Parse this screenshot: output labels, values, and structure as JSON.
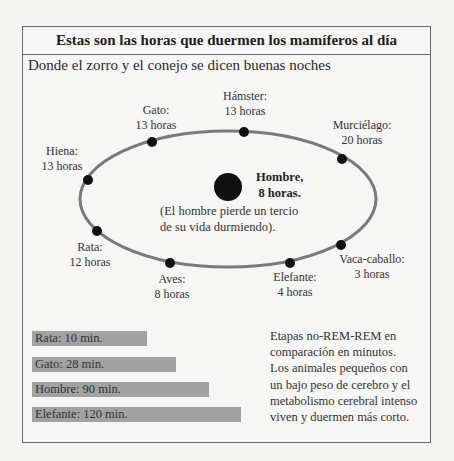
{
  "title": "Estas son las horas que duermen los mamíferos al día",
  "subtitle": "Donde el zorro y el conejo se dicen buenas noches",
  "center": {
    "label_line1": "Hombre,",
    "label_line2": "8 horas.",
    "caption_line1": "(El hombre pierde un tercio",
    "caption_line2": "de su vida durmiendo)."
  },
  "orbit": [
    {
      "animal": "Gato:",
      "hours": "13 horas"
    },
    {
      "animal": "Hámster:",
      "hours": "13 horas"
    },
    {
      "animal": "Murciélago:",
      "hours": "20 horas"
    },
    {
      "animal": "Hiena:",
      "hours": "13 horas"
    },
    {
      "animal": "Rata:",
      "hours": "12 horas"
    },
    {
      "animal": "Aves:",
      "hours": "8 horas"
    },
    {
      "animal": "Elefante:",
      "hours": "4 horas"
    },
    {
      "animal": "Vaca-caballo:",
      "hours": "3 horas"
    }
  ],
  "rem_bars": [
    {
      "label": "Rata: 10 min.",
      "minutes": 10
    },
    {
      "label": "Gato: 28 min.",
      "minutes": 28
    },
    {
      "label": "Hombre: 90 min.",
      "minutes": 90
    },
    {
      "label": "Elefante: 120 min.",
      "minutes": 120
    }
  ],
  "note_lines": [
    "Etapas no-REM-REM en",
    "comparación en minutos.",
    "Los animales pequeños con",
    "un bajo peso de cerebro y el",
    "metabolismo cerebral intenso",
    "viven y duermen más corto."
  ],
  "colors": {
    "orbit_line": "#7a7a7a",
    "dot": "#111111",
    "bar": "#a2a2a2",
    "border": "#6a6a6a"
  }
}
